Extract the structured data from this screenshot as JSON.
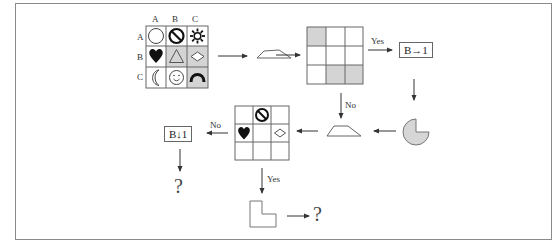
{
  "diagram": {
    "source_grid": {
      "column_headers": [
        "A",
        "B",
        "C"
      ],
      "row_headers": [
        "A",
        "B",
        "C"
      ],
      "cells": [
        [
          {
            "symbol": "circle-outline",
            "shaded": false
          },
          {
            "symbol": "prohibition-sign",
            "shaded": false
          },
          {
            "symbol": "sun-gear",
            "shaded": false
          }
        ],
        [
          {
            "symbol": "heart-filled",
            "shaded": false
          },
          {
            "symbol": "triangle-outline",
            "shaded": true
          },
          {
            "symbol": "diamond-outline",
            "shaded": true
          }
        ],
        [
          {
            "symbol": "crescent-moon",
            "shaded": false
          },
          {
            "symbol": "smiley-face",
            "shaded": false
          },
          {
            "symbol": "arch-filled",
            "shaded": true
          }
        ]
      ]
    },
    "shape_1": "trapezoid",
    "pattern_grid": {
      "shaded_cells": [
        [
          0,
          0
        ],
        [
          2,
          1
        ],
        [
          2,
          2
        ]
      ]
    },
    "yes_label_1": "Yes",
    "no_label_1": "No",
    "result_box_1": "B→1",
    "pacman_shape": "circle-missing-quarter",
    "shape_2": "trapezoid",
    "result_grid": {
      "cells": [
        [
          "",
          "prohibition-sign",
          ""
        ],
        [
          "heart-filled",
          "",
          "diamond-outline"
        ],
        [
          "",
          "",
          ""
        ]
      ]
    },
    "no_label_2": "No",
    "result_box_2": "B↓1",
    "question_1": "?",
    "yes_label_2": "Yes",
    "l_shape": "l-shape-outline",
    "question_2": "?"
  },
  "colors": {
    "line": "#555555",
    "shade": "#d4d4d4",
    "frame": "#8a8a8a"
  }
}
